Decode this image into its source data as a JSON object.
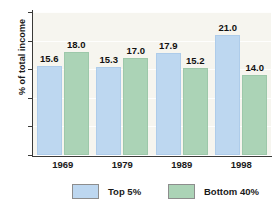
{
  "chart_data": {
    "type": "bar",
    "title": "",
    "xlabel": "",
    "ylabel": "% of total income",
    "categories": [
      "1969",
      "1979",
      "1989",
      "1998"
    ],
    "series": [
      {
        "name": "Top 5%",
        "color": "#bdd7f0",
        "values": [
          15.6,
          15.3,
          17.9,
          21.0
        ],
        "labels": [
          "15.6",
          "15.3",
          "17.9",
          "21.0"
        ]
      },
      {
        "name": "Bottom 40%",
        "color": "#abd3b6",
        "values": [
          18.0,
          17.0,
          15.2,
          14.0
        ],
        "labels": [
          "18.0",
          "17.0",
          "15.2",
          "14.0"
        ]
      }
    ],
    "ylim": [
      0,
      25
    ],
    "yticks": [
      0,
      5,
      10,
      15,
      20,
      25
    ],
    "ytick_labels": [
      "0",
      "5",
      "10",
      "15",
      "20",
      "25"
    ],
    "grid": true,
    "legend_position": "bottom",
    "plot_background": "#f6f5ef",
    "axis_color": "#3a3a38"
  },
  "yticks": [
    {
      "label": "25"
    },
    {
      "label": "20"
    },
    {
      "label": "15"
    },
    {
      "label": "10"
    },
    {
      "label": "5"
    },
    {
      "label": "0"
    }
  ],
  "groups": [
    {
      "year": "1969",
      "top5": "15.6",
      "bottom40": "18.0"
    },
    {
      "year": "1979",
      "top5": "15.3",
      "bottom40": "17.0"
    },
    {
      "year": "1989",
      "top5": "17.9",
      "bottom40": "15.2"
    },
    {
      "year": "1998",
      "top5": "21.0",
      "bottom40": "14.0"
    }
  ],
  "legend": {
    "top5_label": "Top 5%",
    "bottom40_label": "Bottom 40%"
  },
  "axis": {
    "y_title": "% of total income"
  }
}
